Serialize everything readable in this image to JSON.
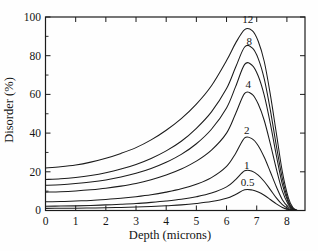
{
  "figure": {
    "background": "#fefefe",
    "line_color": "#1b1b1b",
    "text_color": "#141414"
  },
  "chart_data": {
    "type": "line",
    "title": "",
    "xlabel": "Depth (microns)",
    "ylabel": "Disorder (%)",
    "xlim": [
      0,
      8.6
    ],
    "ylim": [
      0,
      100
    ],
    "x_ticks": [
      0,
      1,
      2,
      3,
      4,
      5,
      6,
      7,
      8
    ],
    "y_ticks": [
      0,
      20,
      40,
      60,
      80,
      100
    ],
    "y_minor_ticks": [
      10,
      30,
      50,
      70,
      90
    ],
    "grid": false,
    "legend_position": "none",
    "annotation_note": "each curve annotated near its peak with its dose value",
    "series": [
      {
        "name": "dose-12",
        "label": "12",
        "label_pos": [
          6.7,
          98.5
        ],
        "points": [
          [
            0,
            22
          ],
          [
            0.5,
            22.6
          ],
          [
            1,
            23.5
          ],
          [
            1.5,
            25
          ],
          [
            2,
            27
          ],
          [
            2.5,
            29.5
          ],
          [
            3,
            32.5
          ],
          [
            3.5,
            36.5
          ],
          [
            4,
            41.5
          ],
          [
            4.5,
            47.5
          ],
          [
            5,
            55
          ],
          [
            5.5,
            64.5
          ],
          [
            6,
            77.5
          ],
          [
            6.3,
            86.5
          ],
          [
            6.6,
            93.5
          ],
          [
            6.85,
            93
          ],
          [
            7.05,
            87.5
          ],
          [
            7.25,
            77
          ],
          [
            7.45,
            60
          ],
          [
            7.65,
            40
          ],
          [
            7.85,
            20
          ],
          [
            8.05,
            6.5
          ],
          [
            8.2,
            1.5
          ],
          [
            8.35,
            0
          ]
        ]
      },
      {
        "name": "dose-8",
        "label": "8",
        "label_pos": [
          6.75,
          87.5
        ],
        "points": [
          [
            0,
            16
          ],
          [
            0.5,
            16.4
          ],
          [
            1,
            17.1
          ],
          [
            1.5,
            18.1
          ],
          [
            2,
            19.5
          ],
          [
            2.5,
            21.4
          ],
          [
            3,
            23.8
          ],
          [
            3.5,
            26.9
          ],
          [
            4,
            30.8
          ],
          [
            4.5,
            35.8
          ],
          [
            5,
            42.5
          ],
          [
            5.5,
            51
          ],
          [
            6,
            63
          ],
          [
            6.3,
            74
          ],
          [
            6.6,
            84.5
          ],
          [
            6.85,
            84
          ],
          [
            7.05,
            78.5
          ],
          [
            7.25,
            68
          ],
          [
            7.45,
            52
          ],
          [
            7.65,
            33.5
          ],
          [
            7.85,
            16.5
          ],
          [
            8.05,
            5
          ],
          [
            8.2,
            1
          ],
          [
            8.35,
            0
          ]
        ]
      },
      {
        "name": "dose-unlabeled",
        "label": "",
        "label_pos": [
          6.7,
          80
        ],
        "points": [
          [
            0,
            13
          ],
          [
            0.5,
            13.3
          ],
          [
            1,
            13.9
          ],
          [
            1.5,
            14.7
          ],
          [
            2,
            15.8
          ],
          [
            2.5,
            17.3
          ],
          [
            3,
            19.2
          ],
          [
            3.5,
            21.7
          ],
          [
            4,
            24.9
          ],
          [
            4.5,
            29
          ],
          [
            5,
            34.5
          ],
          [
            5.5,
            42
          ],
          [
            6,
            53
          ],
          [
            6.3,
            64
          ],
          [
            6.6,
            75.5
          ],
          [
            6.85,
            75
          ],
          [
            7.05,
            69.5
          ],
          [
            7.25,
            59.5
          ],
          [
            7.45,
            45
          ],
          [
            7.65,
            28.5
          ],
          [
            7.85,
            13.5
          ],
          [
            8.05,
            4
          ],
          [
            8.2,
            0.8
          ],
          [
            8.35,
            0
          ]
        ]
      },
      {
        "name": "dose-4",
        "label": "4",
        "label_pos": [
          6.72,
          65
        ],
        "points": [
          [
            0,
            9.5
          ],
          [
            0.5,
            9.7
          ],
          [
            1,
            10.1
          ],
          [
            1.5,
            10.7
          ],
          [
            2,
            11.5
          ],
          [
            2.5,
            12.6
          ],
          [
            3,
            14
          ],
          [
            3.5,
            15.9
          ],
          [
            4,
            18.3
          ],
          [
            4.5,
            21.4
          ],
          [
            5,
            25.5
          ],
          [
            5.5,
            31.2
          ],
          [
            6,
            40
          ],
          [
            6.3,
            50
          ],
          [
            6.6,
            60.5
          ],
          [
            6.85,
            60
          ],
          [
            7.05,
            55
          ],
          [
            7.25,
            46.5
          ],
          [
            7.45,
            34.5
          ],
          [
            7.65,
            21.5
          ],
          [
            7.85,
            10
          ],
          [
            8.05,
            3
          ],
          [
            8.2,
            0.6
          ],
          [
            8.35,
            0
          ]
        ]
      },
      {
        "name": "dose-2",
        "label": "2",
        "label_pos": [
          6.67,
          41.5
        ],
        "points": [
          [
            0,
            4.5
          ],
          [
            0.5,
            4.6
          ],
          [
            1,
            4.9
          ],
          [
            1.5,
            5.2
          ],
          [
            2,
            5.7
          ],
          [
            2.5,
            6.3
          ],
          [
            3,
            7.1
          ],
          [
            3.5,
            8.1
          ],
          [
            4,
            9.5
          ],
          [
            4.5,
            11.2
          ],
          [
            5,
            13.6
          ],
          [
            5.5,
            17
          ],
          [
            6,
            22.8
          ],
          [
            6.3,
            29.5
          ],
          [
            6.6,
            37.5
          ],
          [
            6.85,
            37
          ],
          [
            7.05,
            33.5
          ],
          [
            7.25,
            27.5
          ],
          [
            7.45,
            20
          ],
          [
            7.65,
            12.3
          ],
          [
            7.85,
            5.6
          ],
          [
            8.05,
            1.7
          ],
          [
            8.2,
            0.3
          ],
          [
            8.35,
            0
          ]
        ]
      },
      {
        "name": "dose-1",
        "label": "1",
        "label_pos": [
          6.67,
          23.5
        ],
        "points": [
          [
            0,
            2.2
          ],
          [
            0.5,
            2.3
          ],
          [
            1,
            2.4
          ],
          [
            1.5,
            2.6
          ],
          [
            2,
            2.9
          ],
          [
            2.5,
            3.2
          ],
          [
            3,
            3.6
          ],
          [
            3.5,
            4.2
          ],
          [
            4,
            4.9
          ],
          [
            4.5,
            5.8
          ],
          [
            5,
            7.1
          ],
          [
            5.5,
            9
          ],
          [
            6,
            12.2
          ],
          [
            6.3,
            16
          ],
          [
            6.6,
            20.5
          ],
          [
            6.85,
            20.3
          ],
          [
            7.05,
            18.3
          ],
          [
            7.25,
            15
          ],
          [
            7.45,
            10.8
          ],
          [
            7.65,
            6.5
          ],
          [
            7.85,
            3
          ],
          [
            8.05,
            0.9
          ],
          [
            8.2,
            0.2
          ],
          [
            8.35,
            0
          ]
        ]
      },
      {
        "name": "dose-0.5",
        "label": "0.5",
        "label_pos": [
          6.7,
          14.7
        ],
        "points": [
          [
            0,
            1.1
          ],
          [
            0.5,
            1.15
          ],
          [
            1,
            1.2
          ],
          [
            1.5,
            1.3
          ],
          [
            2,
            1.4
          ],
          [
            2.5,
            1.6
          ],
          [
            3,
            1.8
          ],
          [
            3.5,
            2.1
          ],
          [
            4,
            2.5
          ],
          [
            4.5,
            2.9
          ],
          [
            5,
            3.6
          ],
          [
            5.5,
            4.6
          ],
          [
            6,
            6.3
          ],
          [
            6.3,
            8.3
          ],
          [
            6.6,
            10.7
          ],
          [
            6.85,
            10.6
          ],
          [
            7.05,
            9.6
          ],
          [
            7.25,
            7.9
          ],
          [
            7.45,
            5.7
          ],
          [
            7.65,
            3.4
          ],
          [
            7.85,
            1.6
          ],
          [
            8.05,
            0.5
          ],
          [
            8.2,
            0.1
          ],
          [
            8.35,
            0
          ]
        ]
      }
    ]
  }
}
